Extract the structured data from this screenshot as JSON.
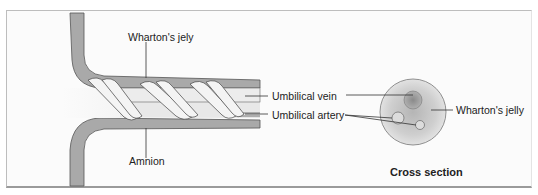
{
  "figure": {
    "type": "anatomical-diagram",
    "labels": {
      "whartons_jelly_top": "Wharton's jely",
      "amnion": "Amnion",
      "umbilical_vein": "Umbilical vein",
      "umbilical_artery": "Umbilical artery",
      "whartons_jelly_cross": "Wharton's jelly",
      "cross_section_title": "Cross section"
    },
    "colors": {
      "amnion_fill": "#a9a9a9",
      "cord_fill": "#e6e6e6",
      "vessel_fill": "#f2f2f2",
      "cross_section_fill": "#c8c8c8",
      "outline": "#555555",
      "label_text": "#222222",
      "background": "#fbfbfb"
    }
  }
}
